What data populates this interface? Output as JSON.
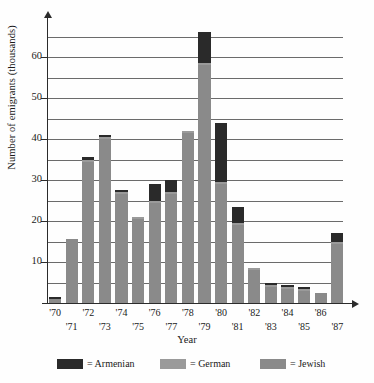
{
  "chart_data": {
    "type": "bar",
    "title": "",
    "subtitle": "",
    "xlabel": "Year",
    "ylabel": "Number of emigrants (thousands)",
    "stacked": true,
    "grid": true,
    "legend_position": "bottom",
    "ylim": [
      0,
      70
    ],
    "ytick_labels": [
      "10",
      "20",
      "30",
      "40",
      "50",
      "60"
    ],
    "ytick_values": [
      10,
      20,
      30,
      40,
      50,
      60
    ],
    "gridline_values": [
      5,
      10,
      15,
      20,
      25,
      30,
      35,
      40,
      45,
      50,
      55,
      60,
      65
    ],
    "categories": [
      "'70",
      "'71",
      "'72",
      "'73",
      "'74",
      "'75",
      "'76",
      "'77",
      "'78",
      "'79",
      "'80",
      "'81",
      "'82",
      "'83",
      "'84",
      "'85",
      "'86",
      "'87"
    ],
    "series": [
      {
        "name": "Jewish",
        "color": "#8a8a8a",
        "values": [
          1.0,
          15.5,
          34.5,
          40.0,
          26.5,
          20.5,
          24.5,
          26.5,
          41.5,
          58.0,
          29.0,
          19.0,
          8.0,
          4.0,
          3.5,
          3.0,
          2.5,
          14.5
        ]
      },
      {
        "name": "German",
        "color": "#9a9a9a",
        "values": [
          0.0,
          0.0,
          0.5,
          0.5,
          0.5,
          0.5,
          0.5,
          0.5,
          0.5,
          0.5,
          0.5,
          0.5,
          0.5,
          0.3,
          0.3,
          0.3,
          0.0,
          0.5
        ]
      },
      {
        "name": "Armenian",
        "color": "#2a2a2a",
        "values": [
          0.5,
          0.0,
          0.5,
          0.5,
          0.5,
          0.0,
          4.0,
          3.0,
          0.0,
          7.5,
          14.5,
          4.0,
          0.0,
          0.7,
          0.7,
          0.7,
          0.0,
          2.0
        ]
      }
    ],
    "totals": [
      1.5,
      15.5,
      35.5,
      41.0,
      27.5,
      21.0,
      29.0,
      30.0,
      42.0,
      66.0,
      44.0,
      23.5,
      8.5,
      5.0,
      4.5,
      4.0,
      2.5,
      17.0
    ]
  },
  "axis": {
    "y_title": "Number of emigrants (thousands)",
    "x_title": "Year",
    "y_ticks": [
      {
        "label": "60",
        "value": 60
      },
      {
        "label": "50",
        "value": 50
      },
      {
        "label": "40",
        "value": 40
      },
      {
        "label": "30",
        "value": 30
      },
      {
        "label": "20",
        "value": 20
      },
      {
        "label": "10",
        "value": 10
      }
    ]
  },
  "legend": {
    "items": [
      {
        "label": "= Armenian",
        "color": "#2a2a2a",
        "name": "armenian"
      },
      {
        "label": "= German",
        "color": "#9a9a9a",
        "name": "german"
      },
      {
        "label": "= Jewish",
        "color": "#8a8a8a",
        "name": "jewish"
      }
    ]
  }
}
